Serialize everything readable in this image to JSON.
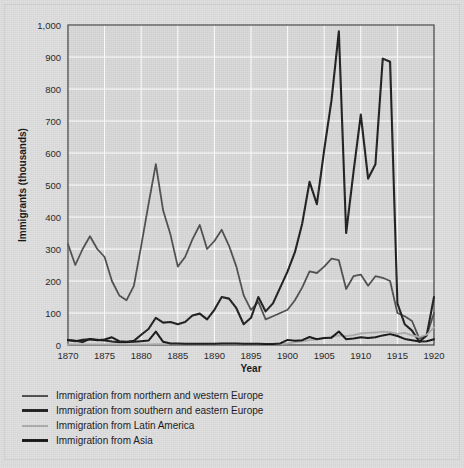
{
  "chart_data": {
    "type": "line",
    "title": "",
    "xlabel": "Year",
    "ylabel": "Immigrants (thousands)",
    "xlim": [
      1870,
      1920
    ],
    "ylim": [
      0,
      1000
    ],
    "xticks": [
      1870,
      1875,
      1880,
      1885,
      1890,
      1895,
      1900,
      1905,
      1910,
      1915,
      1920
    ],
    "yticks": [
      0,
      100,
      200,
      300,
      400,
      500,
      600,
      700,
      800,
      900,
      1000
    ],
    "ytick_labels": [
      "0",
      "100",
      "200",
      "300",
      "400",
      "500",
      "600",
      "700",
      "800",
      "900",
      "1,000"
    ],
    "grid": true,
    "legend_position": "below",
    "x": [
      1870,
      1871,
      1872,
      1873,
      1874,
      1875,
      1876,
      1877,
      1878,
      1879,
      1880,
      1881,
      1882,
      1883,
      1884,
      1885,
      1886,
      1887,
      1888,
      1889,
      1890,
      1891,
      1892,
      1893,
      1894,
      1895,
      1896,
      1897,
      1898,
      1899,
      1900,
      1901,
      1902,
      1903,
      1904,
      1905,
      1906,
      1907,
      1908,
      1909,
      1910,
      1911,
      1912,
      1913,
      1914,
      1915,
      1916,
      1917,
      1918,
      1919,
      1920
    ],
    "series": [
      {
        "name": "Immigration from northern and western Europe",
        "color": "#4a4a4a",
        "values": [
          315,
          250,
          300,
          340,
          300,
          275,
          200,
          155,
          140,
          185,
          310,
          440,
          565,
          420,
          345,
          245,
          275,
          330,
          375,
          300,
          325,
          360,
          310,
          245,
          155,
          110,
          135,
          80,
          90,
          100,
          110,
          140,
          180,
          230,
          225,
          245,
          270,
          265,
          175,
          215,
          220,
          185,
          215,
          210,
          200,
          100,
          90,
          75,
          20,
          30,
          100
        ]
      },
      {
        "name": "Immigration from southern and eastern Europe",
        "color": "#1a1a1a",
        "values": [
          15,
          12,
          16,
          18,
          16,
          14,
          11,
          9,
          9,
          13,
          32,
          50,
          85,
          70,
          72,
          65,
          72,
          92,
          98,
          80,
          110,
          150,
          145,
          115,
          65,
          85,
          150,
          105,
          130,
          180,
          230,
          290,
          380,
          510,
          440,
          610,
          765,
          980,
          350,
          540,
          720,
          520,
          565,
          895,
          885,
          130,
          65,
          45,
          10,
          30,
          150
        ]
      },
      {
        "name": "Immigration from Latin America",
        "color": "#a8a8a8",
        "values": [
          2,
          2,
          2,
          2,
          2,
          2,
          2,
          2,
          2,
          2,
          2,
          2,
          3,
          3,
          3,
          3,
          3,
          3,
          3,
          3,
          3,
          3,
          3,
          3,
          3,
          3,
          3,
          3,
          3,
          3,
          5,
          8,
          11,
          15,
          18,
          22,
          26,
          30,
          28,
          31,
          36,
          38,
          39,
          42,
          40,
          35,
          38,
          30,
          25,
          32,
          55
        ]
      },
      {
        "name": "Immigration from Asia",
        "color": "#111111",
        "values": [
          16,
          13,
          9,
          19,
          15,
          17,
          24,
          12,
          10,
          10,
          12,
          14,
          42,
          10,
          5,
          5,
          4,
          4,
          4,
          4,
          4,
          5,
          5,
          5,
          4,
          4,
          4,
          3,
          3,
          5,
          16,
          13,
          15,
          25,
          18,
          22,
          23,
          42,
          18,
          20,
          24,
          22,
          24,
          30,
          34,
          28,
          19,
          15,
          11,
          12,
          18
        ]
      }
    ]
  },
  "legend": {
    "items": [
      {
        "label": "Immigration from northern and western Europe",
        "color": "#4a4a4a",
        "width": 2
      },
      {
        "label": "Immigration from southern and eastern Europe",
        "color": "#1a1a1a",
        "width": 3
      },
      {
        "label": "Immigration from Latin America",
        "color": "#a8a8a8",
        "width": 2
      },
      {
        "label": "Immigration from Asia",
        "color": "#111111",
        "width": 3
      }
    ]
  }
}
